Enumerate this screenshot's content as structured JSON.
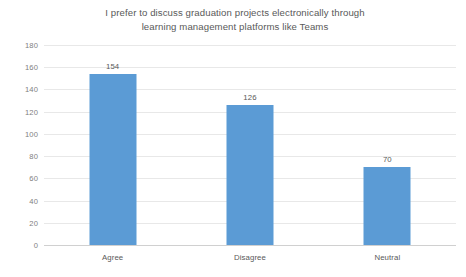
{
  "chart_data": {
    "type": "bar",
    "title": "I prefer to discuss graduation projects electronically through learning management platforms like Teams",
    "title_lines": [
      "I prefer to discuss graduation projects electronically through",
      "learning management platforms like Teams"
    ],
    "categories": [
      "Agree",
      "Disagree",
      "Neutral"
    ],
    "values": [
      154,
      126,
      70
    ],
    "data_labels": [
      "154",
      "126",
      "70"
    ],
    "xlabel": "",
    "ylabel": "",
    "ylim": [
      0,
      180
    ],
    "ytick_step": 20,
    "ytick_labels": [
      "180",
      "160",
      "140",
      "120",
      "100",
      "80",
      "60",
      "40",
      "20",
      "0"
    ],
    "ytick_values": [
      180,
      160,
      140,
      120,
      100,
      80,
      60,
      40,
      20,
      0
    ],
    "grid": true,
    "grid_axis": "y",
    "legend": false,
    "legend_position": "none",
    "series": [
      {
        "name": "",
        "values": [
          154,
          126,
          70
        ],
        "color": "#5B9BD5"
      }
    ],
    "colors": {
      "bar": "#5B9BD5",
      "gridline": "#E8E8E8",
      "baseline": "#D0D0D0",
      "text": "#595959",
      "tick_text": "#808080",
      "background": "#FFFFFF"
    }
  }
}
